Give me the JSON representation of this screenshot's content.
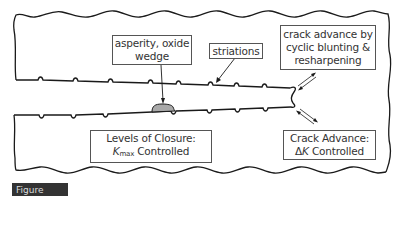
{
  "diagram": {
    "type": "fatigue-crack-schematic",
    "colors": {
      "outline": "#1a1a1a",
      "box_border": "#555555",
      "asperity_fill": "#a9a9a9",
      "text": "#333333",
      "figure_bar": "#333333"
    },
    "labels": {
      "asperity": {
        "line1": "asperity, oxide",
        "line2": "wedge"
      },
      "striations": {
        "line1": "striations"
      },
      "crack_advance_mech": {
        "line1": "crack advance by",
        "line2": "cyclic blunting &",
        "line3": "resharpening"
      },
      "closure": {
        "line1": "Levels of Closure:",
        "k_symbol": "K",
        "k_sub": "max",
        "line2_rest": " Controlled"
      },
      "crack_advance_dk": {
        "line1": "Crack Advance:",
        "delta": "Δ",
        "k_symbol": "K",
        "line2_rest": " Controlled"
      }
    },
    "figure_label": "Figure 10.15"
  }
}
